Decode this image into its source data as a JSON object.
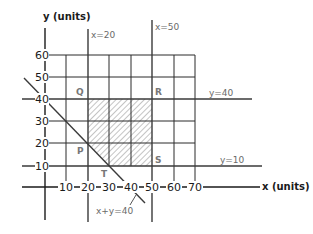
{
  "diagram": {
    "type": "linear-programming feasible region",
    "x_axis": {
      "label": "x (units)",
      "ticks": [
        "10",
        "20",
        "30",
        "40",
        "50",
        "60",
        "70"
      ]
    },
    "y_axis": {
      "label": "y (units)",
      "ticks": [
        "10",
        "20",
        "30",
        "40",
        "50",
        "60"
      ]
    },
    "constraint_lines": [
      {
        "label": "x=20"
      },
      {
        "label": "x=50"
      },
      {
        "label": "y=40"
      },
      {
        "label": "y=10"
      },
      {
        "label": "x+y=40"
      }
    ],
    "points": [
      {
        "label": "Q",
        "x": 20,
        "y": 40
      },
      {
        "label": "R",
        "x": 50,
        "y": 40
      },
      {
        "label": "S",
        "x": 50,
        "y": 10
      },
      {
        "label": "T",
        "x": 30,
        "y": 10
      },
      {
        "label": "P",
        "x": 20,
        "y": 20
      }
    ],
    "shaded_region": "feasible region bounded by P, Q, R, S, T",
    "colors": {
      "grid": "#2a2a2a",
      "annotation": "#6a6a6a",
      "hatch": "#8a8a8a"
    }
  }
}
